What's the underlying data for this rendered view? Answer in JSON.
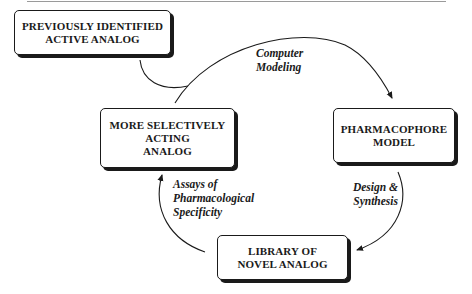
{
  "diagram": {
    "type": "cycle",
    "nodes": [
      {
        "id": "previously-identified",
        "lines": [
          "PREVIOUSLY IDENTIFIED",
          "ACTIVE ANALOG"
        ]
      },
      {
        "id": "pharmacophore-model",
        "lines": [
          "PHARMACOPHORE",
          "MODEL"
        ]
      },
      {
        "id": "library-novel-analog",
        "lines": [
          "LIBRARY OF",
          "NOVEL ANALOG"
        ]
      },
      {
        "id": "more-selective-analog",
        "lines": [
          "MORE SELECTIVELY",
          "ACTING",
          "ANALOG"
        ]
      }
    ],
    "edges": [
      {
        "from": "previously-identified",
        "to": "pharmacophore-model",
        "lines": [
          "Computer",
          "Modeling"
        ]
      },
      {
        "from": "more-selective-analog",
        "to": "pharmacophore-model",
        "lines": [
          "Computer",
          "Modeling"
        ]
      },
      {
        "from": "pharmacophore-model",
        "to": "library-novel-analog",
        "lines": [
          "Design &",
          "Synthesis"
        ]
      },
      {
        "from": "library-novel-analog",
        "to": "more-selective-analog",
        "lines": [
          "Assays of",
          "Pharmacological",
          "Specificity"
        ]
      }
    ]
  }
}
